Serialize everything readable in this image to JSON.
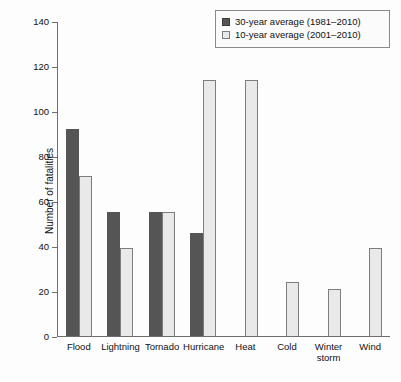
{
  "chart_data": {
    "type": "bar",
    "title": "",
    "xlabel": "",
    "ylabel": "Number of fatalities",
    "ylim": [
      0,
      140
    ],
    "yticks": [
      0,
      20,
      40,
      60,
      80,
      100,
      120,
      140
    ],
    "grid": false,
    "legend_position": "top-right",
    "categories": [
      "Flood",
      "Lightning",
      "Tornado",
      "Hurricane",
      "Heat",
      "Cold",
      "Winter storm",
      "Wind"
    ],
    "series": [
      {
        "name": "30-year average (1981–2010)",
        "color": "#555555",
        "values": [
          92,
          55,
          55,
          46,
          null,
          null,
          null,
          null
        ]
      },
      {
        "name": "10-year average (2001–2010)",
        "color": "#e9e9e9",
        "values": [
          71,
          39,
          55,
          114,
          114,
          24,
          21,
          39
        ]
      }
    ]
  },
  "legend": {
    "items": [
      {
        "label": "30-year average (1981–2010)",
        "swatch": "dark"
      },
      {
        "label": "10-year average (2001–2010)",
        "swatch": "light"
      }
    ]
  },
  "colors": {
    "dark_bar": "#555555",
    "light_bar": "#e9e9e9",
    "outline": "#7d7d7d",
    "axis": "#6f6f6f",
    "background": "#fdfdfd"
  }
}
